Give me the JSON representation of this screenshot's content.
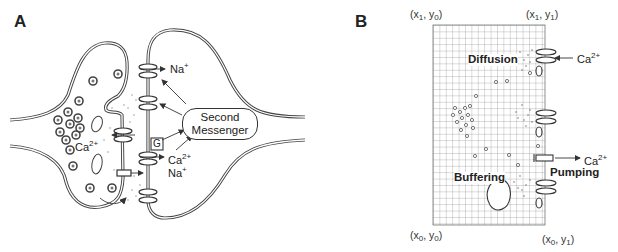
{
  "figure": {
    "panel_a": {
      "label": "A",
      "ion_labels": {
        "na_top": "Na",
        "na_top_charge": "+",
        "ca_left": "Ca",
        "ca_left_charge": "2+",
        "ca_right": "Ca",
        "ca_right_charge": "2+",
        "na_right": "Na",
        "na_right_charge": "+"
      },
      "second_messenger": {
        "line1": "Second",
        "line2": "Messenger"
      },
      "g_protein_label": "G"
    },
    "panel_b": {
      "label": "B",
      "corners": {
        "top_left": {
          "x": "x",
          "x_sub": "1",
          "y": "y",
          "y_sub": "0"
        },
        "top_right": {
          "x": "x",
          "x_sub": "1",
          "y": "y",
          "y_sub": "1"
        },
        "bottom_left": {
          "x": "x",
          "x_sub": "0",
          "y": "y",
          "y_sub": "0"
        },
        "bottom_right": {
          "x": "x",
          "x_sub": "0",
          "y": "y",
          "y_sub": "1"
        }
      },
      "process_labels": {
        "diffusion": "Diffusion",
        "buffering": "Buffering",
        "pumping": "Pumping"
      },
      "ion_labels": {
        "ca_in": "Ca",
        "ca_in_charge": "2+",
        "ca_out": "Ca",
        "ca_out_charge": "2+"
      }
    }
  },
  "colors": {
    "line": "#333333",
    "membrane_fill": "#bfbfbf",
    "grid": "#8a8a8a",
    "background": "#ffffff"
  }
}
